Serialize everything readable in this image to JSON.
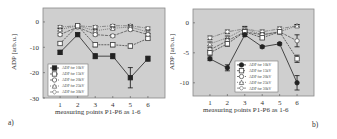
{
  "chart_data": [
    {
      "type": "line",
      "panel_label": "a)",
      "title": "",
      "xlabel": "measuring points P1-P6 as 1-6",
      "ylabel": "ADP [arb.u.]",
      "x": [
        1,
        2,
        3,
        4,
        5,
        6
      ],
      "xticks": [
        "1",
        "2",
        "3",
        "4",
        "5",
        "6"
      ],
      "yticks": [
        "0",
        "-10",
        "-20",
        "-30"
      ],
      "ytick_values": [
        0,
        -10,
        -20,
        -30
      ],
      "ylim": [
        -30,
        5.5
      ],
      "grid": false,
      "legend_position": "lower left",
      "background": "#cfcfcf",
      "series": [
        {
          "name": "ADP for 10kV",
          "values": [
            -12,
            -5,
            -13.5,
            -13.5,
            -22,
            -14.5
          ],
          "errors": [
            0.8,
            0.6,
            1,
            1,
            4,
            1
          ],
          "marker": "square-filled",
          "dash": "",
          "color": "#222222"
        },
        {
          "name": "ADP for 15kV",
          "values": [
            -8.5,
            -1.5,
            -9,
            -9,
            -9.5,
            -6.5
          ],
          "errors": [
            0.6,
            0.5,
            0.8,
            0.8,
            0.8,
            0.6
          ],
          "marker": "square-open",
          "dash": "2,1",
          "color": "#444444"
        },
        {
          "name": "ADP for 20kV",
          "values": [
            -5,
            -2,
            -5,
            -5.5,
            -3,
            -5
          ],
          "errors": [
            0.5,
            0.5,
            0.5,
            0.5,
            0.5,
            0.5
          ],
          "marker": "circle-open",
          "dash": "3,1",
          "color": "#555555"
        },
        {
          "name": "ADP for 25kV",
          "values": [
            -3,
            -1.5,
            -3.5,
            -2.5,
            -2,
            -4
          ],
          "errors": [
            0.5,
            0.5,
            0.5,
            0.5,
            0.5,
            0.5
          ],
          "marker": "triangle-open",
          "dash": "1,1",
          "color": "#666666"
        },
        {
          "name": "ADP for 30kV",
          "values": [
            -2,
            -1.5,
            -2,
            -1.5,
            -1.5,
            -2.5
          ],
          "errors": [
            0.5,
            0.5,
            0.5,
            0.5,
            0.5,
            0.5
          ],
          "marker": "diamond-open",
          "dash": "4,1,1,1",
          "color": "#777777"
        }
      ]
    },
    {
      "type": "line",
      "panel_label": "b)",
      "title": "",
      "xlabel": "measuring points P1-P6 as 1-6",
      "ylabel": "ADP [arb.u.]",
      "x": [
        1,
        2,
        3,
        4,
        5,
        6
      ],
      "xticks": [
        "1",
        "2",
        "3",
        "4",
        "5",
        "6"
      ],
      "yticks": [
        "0",
        "-5",
        "-10"
      ],
      "ytick_values": [
        0,
        -5,
        -10
      ],
      "ylim": [
        -12.2,
        2.3
      ],
      "grid": false,
      "legend_position": "lower center",
      "background": "#cfcfcf",
      "series": [
        {
          "name": "ADP for 10kV",
          "values": [
            -6,
            -7.5,
            -2,
            -4,
            -3.5,
            -10
          ],
          "errors": [
            0.3,
            0.5,
            0.3,
            0.2,
            0.2,
            1.2
          ],
          "marker": "circle-filled",
          "dash": "",
          "color": "#222222"
        },
        {
          "name": "ADP for 15kV",
          "values": [
            -5,
            -3.5,
            -1.5,
            -2.5,
            -1.5,
            -6
          ],
          "errors": [
            0.4,
            0.4,
            0.4,
            0.3,
            0.3,
            0.6
          ],
          "marker": "square-open",
          "dash": "2,1",
          "color": "#444444"
        },
        {
          "name": "ADP for 20kV",
          "values": [
            -4.5,
            -3,
            -1.5,
            -2,
            -1.5,
            -3
          ],
          "errors": [
            0.4,
            0.4,
            0.4,
            0.3,
            0.3,
            1
          ],
          "marker": "circle-open",
          "dash": "3,1",
          "color": "#555555"
        },
        {
          "name": "ADP for 25kV",
          "values": [
            -3.5,
            -2.5,
            -1,
            -2,
            -1.5,
            -0.5
          ],
          "errors": [
            0.3,
            0.3,
            0.4,
            0.3,
            0.3,
            0.2
          ],
          "marker": "triangle-open",
          "dash": "1,1",
          "color": "#666666"
        },
        {
          "name": "ADP for 30kV",
          "values": [
            -2.5,
            -1.5,
            -1,
            -1.5,
            -1,
            -0.5
          ],
          "errors": [
            0.3,
            0.3,
            0.3,
            0.3,
            0.3,
            0.2
          ],
          "marker": "diamond-open",
          "dash": "4,1,1,1",
          "color": "#777777"
        }
      ]
    }
  ],
  "panels": {
    "a": {
      "label": "a)",
      "xlabel": "measuring points P1-P6 as 1-6",
      "ylabel": "ADP [arb.u.]"
    },
    "b": {
      "label": "b)",
      "xlabel": "measuring points P1-P6 as 1-6",
      "ylabel": "ADP [arb.u.]"
    }
  }
}
